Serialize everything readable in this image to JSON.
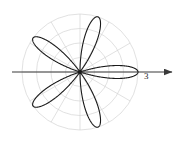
{
  "figure": {
    "name": "polar-rose-plot",
    "kind": "polar-curve",
    "background_color": "#ffffff",
    "center": {
      "x": 80,
      "y": 72
    }
  },
  "axes": {
    "horizontal_axis": {
      "name": "polar-axis",
      "color": "#3a3a3a",
      "from_x": 12,
      "to_x": 172,
      "y": 72,
      "arrow": "right"
    },
    "tick_labels": [
      {
        "text": "3",
        "x": 144,
        "y": 72
      }
    ]
  },
  "grid": {
    "color": "#d4d4d4",
    "radial_line_count": 12,
    "circle_radii": [
      14.5,
      29,
      43.5,
      58
    ],
    "max_radius_px": 58,
    "show": true
  },
  "curve": {
    "name": "rose-curve",
    "color": "#1a1a1a",
    "stroke_width": 1.1,
    "equation_form": "r = a*cos(k*theta)",
    "amplitude": 3,
    "k": 5,
    "petal_count": 10,
    "rotation_deg": 0
  },
  "chart_data": {
    "type": "line",
    "title": "",
    "xlabel": "",
    "ylabel": "",
    "coordinate_system": "polar",
    "legend": [],
    "grid": true,
    "rlim": [
      0,
      3
    ],
    "r_tick_labels": [
      "3"
    ],
    "theta_grid_deg": [
      0,
      30,
      60,
      90,
      120,
      150,
      180,
      210,
      240,
      270,
      300,
      330
    ],
    "series": [
      {
        "name": "r = 3 cos(5θ)",
        "equation": "r = 3*cos(5*theta)",
        "amplitude": 3,
        "k": 5,
        "petals": 10,
        "petal_tip_angles_deg": [
          0,
          36,
          72,
          108,
          144,
          180,
          216,
          252,
          288,
          324
        ],
        "petal_tip_radius": 3
      }
    ]
  }
}
